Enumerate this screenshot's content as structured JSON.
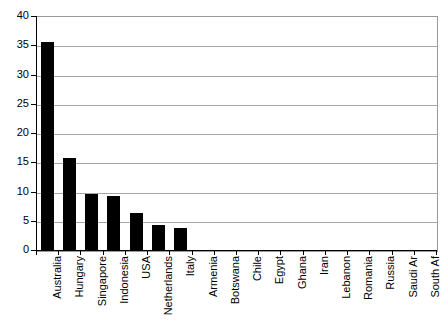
{
  "chart_data": {
    "type": "bar",
    "title": "",
    "subtitle": "",
    "xlabel": "",
    "ylabel": "",
    "ylim": [
      0,
      40
    ],
    "ytick_step": 5,
    "yticks": [
      40,
      35,
      30,
      25,
      20,
      15,
      10,
      5,
      0
    ],
    "grid": true,
    "legend": false,
    "legend_position": "none",
    "orientation": "vertical",
    "bar_color": "#000000",
    "gridline_color": "#a6a6a6",
    "axis_color": "#000000",
    "plot_background": "#ffffff",
    "categories": [
      "Australia",
      "Hungary",
      "Singapore",
      "Indonesia",
      "USA",
      "Netherlands",
      "Italy",
      "Armenia",
      "Botswana",
      "Chile",
      "Egypt",
      "Ghana",
      "Iran",
      "Lebanon",
      "Romania",
      "Russia",
      "Saudi Ar",
      "South Af"
    ],
    "values": [
      35.6,
      15.8,
      9.5,
      9.3,
      6.4,
      4.2,
      3.7,
      0,
      0,
      0,
      0,
      0,
      0,
      0,
      0,
      0,
      0,
      0
    ]
  }
}
